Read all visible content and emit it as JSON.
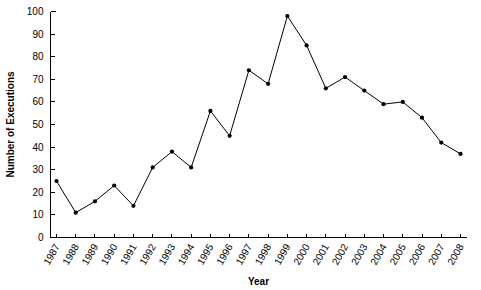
{
  "chart_data": {
    "type": "line",
    "title": "",
    "xlabel": "Year",
    "ylabel": "Number of Executions",
    "grid": false,
    "legend": "none",
    "xlim": [
      1987,
      2008
    ],
    "ylim": [
      0,
      100
    ],
    "ytick_step": 10,
    "yticks": [
      0,
      10,
      20,
      30,
      40,
      50,
      60,
      70,
      80,
      90,
      100
    ],
    "categories": [
      "1987",
      "1988",
      "1989",
      "1990",
      "1991",
      "1992",
      "1993",
      "1994",
      "1995",
      "1996",
      "1997",
      "1998",
      "1999",
      "2000",
      "2001",
      "2002",
      "2003",
      "2004",
      "2005",
      "2006",
      "2007",
      "2008"
    ],
    "series": [
      {
        "name": "Number of Executions",
        "color": "#000000",
        "marker": "filled-circle",
        "values": [
          25,
          11,
          16,
          23,
          14,
          31,
          38,
          31,
          56,
          45,
          74,
          68,
          98,
          85,
          66,
          71,
          65,
          59,
          60,
          53,
          42,
          37
        ]
      }
    ]
  }
}
